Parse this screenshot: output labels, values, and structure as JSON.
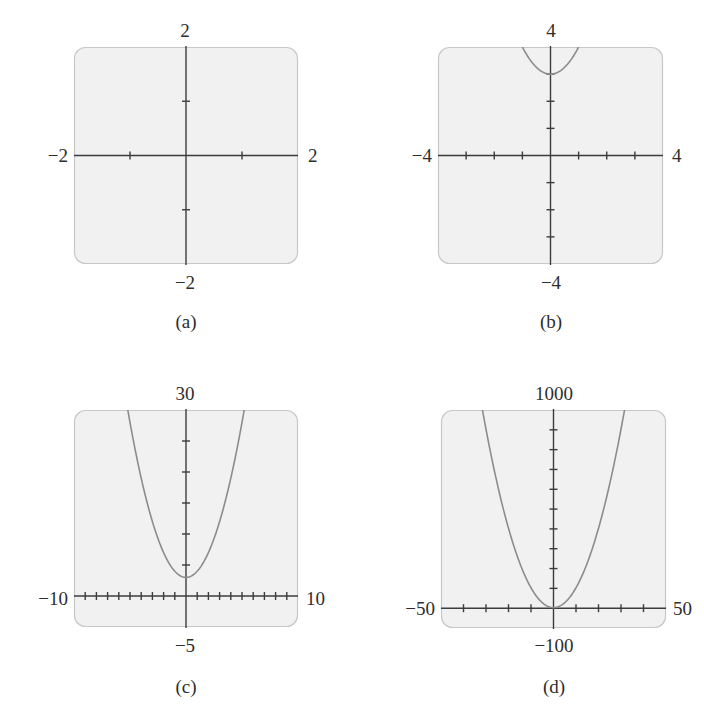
{
  "colors": {
    "plot_background": "#f1f1f1",
    "plot_border": "#c8c8c8",
    "axis": "#3c3c3c",
    "curve": "#8c8c8c",
    "text": "#2e2e2e"
  },
  "panels": [
    {
      "id": "a",
      "caption": "(a)",
      "labels": {
        "ymax": "2",
        "ymin": "−2",
        "xmin": "−2",
        "xmax": "2"
      }
    },
    {
      "id": "b",
      "caption": "(b)",
      "labels": {
        "ymax": "4",
        "ymin": "−4",
        "xmin": "−4",
        "xmax": "4"
      }
    },
    {
      "id": "c",
      "caption": "(c)",
      "labels": {
        "ymax": "30",
        "ymin": "−5",
        "xmin": "−10",
        "xmax": "10"
      }
    },
    {
      "id": "d",
      "caption": "(d)",
      "labels": {
        "ymax": "1000",
        "ymin": "−100",
        "xmin": "−50",
        "xmax": "50"
      }
    }
  ],
  "chart_data": [
    {
      "type": "line",
      "title": "(a)",
      "function": "y = x^2 + 3",
      "xlim": [
        -2,
        2
      ],
      "ylim": [
        -2,
        2
      ],
      "xtick_step": 1,
      "ytick_step": 1,
      "grid": false,
      "curve_visible": false,
      "x": [],
      "y": []
    },
    {
      "type": "line",
      "title": "(b)",
      "function": "y = x^2 + 3",
      "xlim": [
        -4,
        4
      ],
      "ylim": [
        -4,
        4
      ],
      "xtick_step": 1,
      "ytick_step": 1,
      "grid": false,
      "x": [
        -1,
        -0.75,
        -0.5,
        -0.25,
        0,
        0.25,
        0.5,
        0.75,
        1
      ],
      "y": [
        4,
        3.5625,
        3.25,
        3.0625,
        3,
        3.0625,
        3.25,
        3.5625,
        4
      ]
    },
    {
      "type": "line",
      "title": "(c)",
      "function": "y = x^2 + 3",
      "xlim": [
        -10,
        10
      ],
      "ylim": [
        -5,
        30
      ],
      "xtick_step": 1,
      "ytick_step": 5,
      "grid": false,
      "x": [
        -5.2,
        -4,
        -3,
        -2,
        -1,
        0,
        1,
        2,
        3,
        4,
        5.2
      ],
      "y": [
        30,
        19,
        12,
        7,
        4,
        3,
        4,
        7,
        12,
        19,
        30
      ]
    },
    {
      "type": "line",
      "title": "(d)",
      "function": "y = x^2 + 3",
      "xlim": [
        -50,
        50
      ],
      "ylim": [
        -100,
        1000
      ],
      "xtick_step": 10,
      "ytick_step": 100,
      "grid": false,
      "x": [
        -31.6,
        -30,
        -20,
        -10,
        0,
        10,
        20,
        30,
        31.6
      ],
      "y": [
        1000,
        903,
        403,
        103,
        3,
        103,
        403,
        903,
        1000
      ]
    }
  ]
}
